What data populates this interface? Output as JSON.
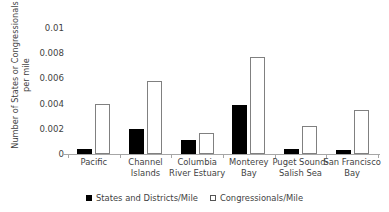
{
  "chart_data": {
    "type": "bar",
    "title": "",
    "xlabel": "",
    "ylabel": "Number of States or Congressionals per mile",
    "ylabel_line1": "Number of States or Congressionals",
    "ylabel_line2": "per mile",
    "ylim": [
      0,
      0.01
    ],
    "ytick_labels": [
      "0.01",
      "0.008",
      "0.006",
      "0.004",
      "0.002",
      "0"
    ],
    "ytick_values": [
      0.01,
      0.008,
      0.006,
      0.004,
      0.002,
      0
    ],
    "grid": false,
    "legend_position": "bottom",
    "categories": [
      "Pacific",
      "Channel Islands",
      "Columbia River Estuary",
      "Monterey Bay",
      "Puget Sound-Salish Sea",
      "San Francisco Bay"
    ],
    "category_lines": [
      [
        "Pacific"
      ],
      [
        "Channel",
        "Islands"
      ],
      [
        "Columbia",
        "River Estuary"
      ],
      [
        "Monterey",
        "Bay"
      ],
      [
        "Puget Sound-",
        "Salish Sea"
      ],
      [
        "San Francisco",
        "Bay"
      ]
    ],
    "series": [
      {
        "name": "States and Districts/Mile",
        "color": "#000000",
        "style": "filled",
        "values": [
          0.0004,
          0.002,
          0.0011,
          0.0039,
          0.0004,
          0.0003
        ]
      },
      {
        "name": "Congressionals/Mile",
        "color": "#ffffff",
        "style": "open",
        "values": [
          0.004,
          0.0058,
          0.0017,
          0.0077,
          0.0022,
          0.0035
        ]
      }
    ]
  },
  "legend": {
    "items": [
      {
        "label": "States and Districts/Mile",
        "style": "filled"
      },
      {
        "label": "Congressionals/Mile",
        "style": "open"
      }
    ]
  }
}
